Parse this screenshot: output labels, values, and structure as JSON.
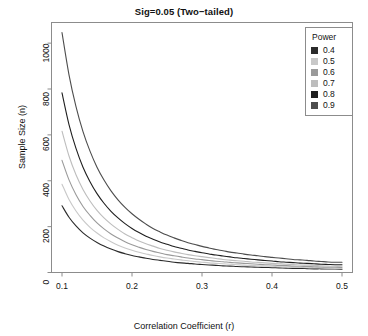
{
  "chart_data": {
    "type": "line",
    "title": "Sig=0.05 (Two−tailed)",
    "xlabel": "Correlation Coefficient (r)",
    "ylabel": "Sample Size (n)",
    "xlim": [
      0.085,
      0.515
    ],
    "ylim": [
      0,
      1090
    ],
    "xticks": [
      0.1,
      0.2,
      0.3,
      0.4,
      0.5
    ],
    "xtick_labels": [
      "0.1",
      "0.2",
      "0.3",
      "0.4",
      "0.5"
    ],
    "yticks": [
      0,
      200,
      400,
      600,
      800,
      1000
    ],
    "ytick_labels": [
      "0",
      "200",
      "400",
      "600",
      "800",
      "1000"
    ],
    "grid": false,
    "legend_position": "top-right",
    "legend_title": "Power",
    "x": [
      0.1,
      0.11,
      0.12,
      0.13,
      0.14,
      0.15,
      0.16,
      0.17,
      0.18,
      0.19,
      0.2,
      0.21,
      0.22,
      0.23,
      0.24,
      0.25,
      0.26,
      0.27,
      0.28,
      0.29,
      0.3,
      0.31,
      0.32,
      0.33,
      0.34,
      0.35,
      0.36,
      0.37,
      0.38,
      0.39,
      0.4,
      0.41,
      0.42,
      0.43,
      0.44,
      0.45,
      0.46,
      0.47,
      0.48,
      0.49,
      0.5
    ],
    "series": [
      {
        "name": "0.4",
        "label": "0.4",
        "color": "#2b2b2b",
        "start_value": 291,
        "end_value": 14,
        "values": [
          291,
          241,
          203,
          173,
          150,
          131,
          115,
          102,
          91,
          82,
          74,
          68,
          62,
          57,
          53,
          49,
          45,
          42,
          40,
          37,
          35,
          33,
          31,
          29,
          28,
          26,
          25,
          24,
          23,
          22,
          21,
          20,
          19,
          18,
          18,
          17,
          16,
          16,
          15,
          15,
          14
        ]
      },
      {
        "name": "0.5",
        "label": "0.5",
        "color": "#c8c8c8",
        "start_value": 385,
        "end_value": 18,
        "values": [
          385,
          318,
          268,
          228,
          197,
          172,
          151,
          134,
          119,
          107,
          97,
          88,
          81,
          74,
          68,
          63,
          59,
          55,
          51,
          48,
          45,
          42,
          40,
          38,
          36,
          34,
          32,
          31,
          29,
          28,
          27,
          25,
          24,
          23,
          22,
          21,
          21,
          20,
          19,
          18,
          18
        ]
      },
      {
        "name": "0.6",
        "label": "0.6",
        "color": "#9a9a9a",
        "start_value": 489,
        "end_value": 22,
        "values": [
          489,
          404,
          339,
          288,
          249,
          216,
          190,
          168,
          150,
          134,
          121,
          110,
          100,
          92,
          85,
          78,
          73,
          68,
          63,
          59,
          56,
          52,
          49,
          47,
          44,
          42,
          40,
          38,
          36,
          34,
          33,
          31,
          30,
          28,
          27,
          26,
          25,
          24,
          23,
          23,
          22
        ]
      },
      {
        "name": "0.7",
        "label": "0.7",
        "color": "#bdbdbd",
        "start_value": 616,
        "end_value": 27,
        "values": [
          616,
          508,
          426,
          362,
          312,
          271,
          238,
          211,
          188,
          168,
          152,
          137,
          125,
          115,
          105,
          97,
          90,
          84,
          78,
          73,
          69,
          65,
          61,
          57,
          54,
          51,
          49,
          46,
          44,
          42,
          40,
          38,
          36,
          35,
          33,
          32,
          31,
          29,
          28,
          27,
          27
        ]
      },
      {
        "name": "0.8",
        "label": "0.8",
        "color": "#1f1f1f",
        "start_value": 783,
        "end_value": 34,
        "values": [
          783,
          645,
          541,
          459,
          396,
          344,
          302,
          267,
          238,
          213,
          192,
          174,
          158,
          145,
          133,
          123,
          113,
          106,
          98,
          92,
          86,
          81,
          76,
          72,
          68,
          64,
          61,
          58,
          55,
          52,
          50,
          47,
          45,
          43,
          41,
          40,
          38,
          36,
          35,
          34,
          34
        ]
      },
      {
        "name": "0.9",
        "label": "0.9",
        "color": "#4d4d4d",
        "start_value": 1046,
        "end_value": 45,
        "values": [
          1046,
          862,
          723,
          614,
          529,
          459,
          403,
          356,
          317,
          284,
          256,
          232,
          211,
          192,
          177,
          163,
          151,
          140,
          130,
          122,
          114,
          107,
          100,
          95,
          89,
          85,
          80,
          76,
          73,
          69,
          66,
          63,
          60,
          57,
          55,
          53,
          50,
          48,
          46,
          45,
          45
        ]
      }
    ]
  },
  "colors": {
    "frame": "#8c8c8c",
    "tick": "#8c8c8c",
    "text": "#111111",
    "background": "#ffffff"
  }
}
